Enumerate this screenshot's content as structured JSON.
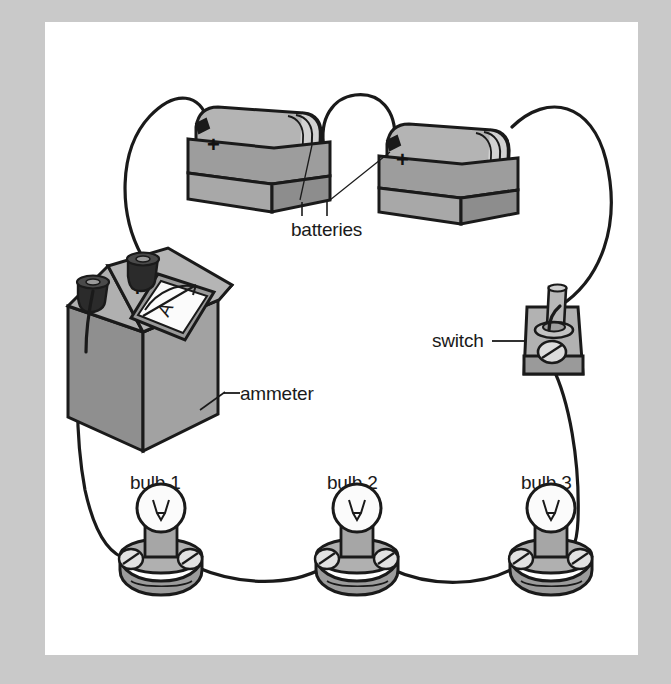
{
  "figure": {
    "type": "circuit-diagram",
    "background_color": "#c9c9c9",
    "plate_color": "#ffffff",
    "ink_color": "#1a1a1a"
  },
  "labels": {
    "batteries": "batteries",
    "ammeter": "ammeter",
    "switch": "switch",
    "bulb1": "bulb 1",
    "bulb2": "bulb 2",
    "bulb3": "bulb 3"
  },
  "markings": {
    "battery1_polarity": "+",
    "battery2_polarity": "+",
    "ammeter_polarity": "+",
    "ammeter_dial_unit": "A"
  },
  "components": [
    {
      "name": "battery-1",
      "label": "batteries",
      "polarity_mark": "+"
    },
    {
      "name": "battery-2",
      "label": "batteries",
      "polarity_mark": "+"
    },
    {
      "name": "ammeter",
      "label": "ammeter",
      "polarity_mark": "+",
      "dial_unit": "A",
      "terminals": 2
    },
    {
      "name": "switch",
      "label": "switch",
      "state": "closed"
    },
    {
      "name": "bulb-1",
      "label": "bulb 1"
    },
    {
      "name": "bulb-2",
      "label": "bulb 2"
    },
    {
      "name": "bulb-3",
      "label": "bulb 3"
    }
  ],
  "palette": {
    "outline": "#1a1a1a",
    "gray_dark": "#8a8a8a",
    "gray_mid": "#a4a4a4",
    "gray_light": "#bdbdbd",
    "gray_lighter": "#d2d2d2",
    "white": "#ffffff",
    "knob_black": "#2b2b2b"
  }
}
